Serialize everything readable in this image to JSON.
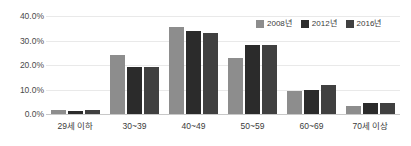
{
  "chart_data": {
    "type": "bar",
    "title": "",
    "subtitle": "",
    "xlabel": "",
    "ylabel": "",
    "categories": [
      "29세 이하",
      "30~39",
      "40~49",
      "50~59",
      "60~69",
      "70세 이상"
    ],
    "series": [
      {
        "name": "2008년",
        "color": "#8d8d8d",
        "values": [
          1.8,
          23.9,
          35.4,
          22.9,
          9.3,
          3.1
        ]
      },
      {
        "name": "2012년",
        "color": "#2b2b2b",
        "values": [
          1.4,
          19.0,
          33.7,
          28.3,
          9.9,
          4.3
        ]
      },
      {
        "name": "2016년",
        "color": "#404040",
        "values": [
          1.8,
          19.0,
          33.1,
          28.3,
          11.9,
          4.6
        ]
      }
    ],
    "ylim": [
      0,
      40
    ],
    "ytick_values": [
      0,
      10,
      20,
      30,
      40
    ],
    "ytick_labels": [
      "0.0%",
      "10.0%",
      "20.0%",
      "30.0%",
      "40.0%"
    ],
    "grid": true,
    "grid_axis": "y",
    "legend_position": "top-right",
    "value_format": "percent"
  },
  "colors": {
    "background": "#ffffff",
    "gridline": "#e9e9e9",
    "axis_line": "#c8c8c8",
    "tick_text": "#4a4a4a",
    "label_text": "#3b3b3b"
  }
}
